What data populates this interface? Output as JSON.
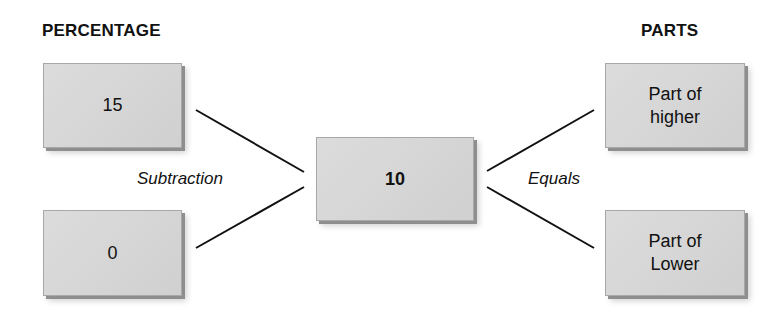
{
  "headings": {
    "left": "PERCENTAGE",
    "right": "PARTS"
  },
  "boxes": {
    "left_top": "15",
    "left_bottom": "0",
    "center": "10",
    "right_top_line1": "Part of",
    "right_top_line2": "higher",
    "right_bottom_line1": "Part of",
    "right_bottom_line2": "Lower"
  },
  "labels": {
    "left": "Subtraction",
    "right": "Equals"
  }
}
